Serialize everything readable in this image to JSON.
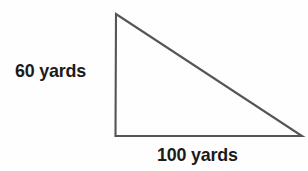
{
  "figure": {
    "name": "right-triangle-diagram",
    "background_color": "#fefefe",
    "stroke_color": "#555555",
    "stroke_width": 2.1,
    "text_color": "#1b1b1b",
    "labels": {
      "vertical_leg": "60 yards",
      "horizontal_leg": "100 yards"
    },
    "geometry": {
      "apex": [
        116,
        14
      ],
      "right_angle_vertex": [
        115.5,
        136
      ],
      "far_vertex": [
        302,
        136
      ],
      "vertical_leg_length_units": 60,
      "horizontal_leg_length_units": 100,
      "units": "yards",
      "right_angle_at": "bottom-left"
    }
  },
  "chart_data": {
    "type": "diagram",
    "shape": "right-triangle",
    "title": "",
    "vertices": [
      {
        "name": "apex",
        "x": 116,
        "y": 14
      },
      {
        "name": "bottom-left",
        "x": 115.5,
        "y": 136
      },
      {
        "name": "bottom-right",
        "x": 302,
        "y": 136
      }
    ],
    "edges": [
      {
        "name": "vertical-leg",
        "from": "apex",
        "to": "bottom-left",
        "label": "60 yards",
        "value": 60
      },
      {
        "name": "horizontal-leg",
        "from": "bottom-left",
        "to": "bottom-right",
        "label": "100 yards",
        "value": 100
      },
      {
        "name": "hypotenuse",
        "from": "bottom-left",
        "to": "apex",
        "label": "",
        "value": null
      }
    ],
    "annotations": [
      "60 yards",
      "100 yards"
    ],
    "units": "yards"
  }
}
